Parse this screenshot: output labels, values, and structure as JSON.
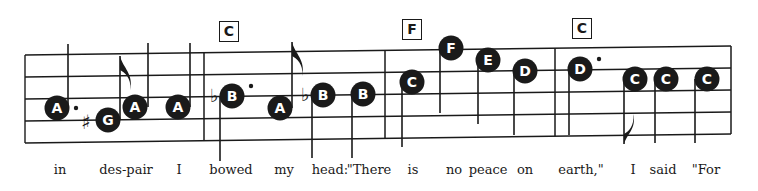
{
  "colors": {
    "ink": "#1a1a1a",
    "paper": "#ffffff",
    "note_text": "#ffffff"
  },
  "staff": {
    "left_x": 25,
    "right_x": 731,
    "lines_left_y": [
      55,
      77,
      99,
      121,
      143
    ],
    "lines_right_y": [
      46,
      68,
      90,
      112,
      134
    ],
    "barlines_x": [
      204,
      385,
      555,
      731
    ]
  },
  "chords": [
    {
      "label": "C",
      "x": 219,
      "y": 21
    },
    {
      "label": "F",
      "x": 402,
      "y": 19
    },
    {
      "label": "C",
      "x": 572,
      "y": 18
    }
  ],
  "notes": [
    {
      "name": "A",
      "cx": 57,
      "cy": 108,
      "stem": "up",
      "stem_x": 68,
      "stem_end": 44,
      "dot": true
    },
    {
      "name": "G",
      "cx": 108,
      "cy": 120,
      "stem": "up",
      "stem_x": 120,
      "stem_end": 56,
      "flag": "up",
      "accidental": "sharp"
    },
    {
      "name": "A",
      "cx": 135,
      "cy": 107,
      "stem": "up",
      "stem_x": 148,
      "stem_end": 43
    },
    {
      "name": "A",
      "cx": 178,
      "cy": 107,
      "stem": "up",
      "stem_x": 190,
      "stem_end": 43
    },
    {
      "name": "B",
      "cx": 232,
      "cy": 96,
      "stem": "down",
      "stem_x": 220,
      "stem_end": 161,
      "dot": true,
      "accidental": "flat"
    },
    {
      "name": "A",
      "cx": 280,
      "cy": 108,
      "stem": "up",
      "stem_x": 292,
      "stem_end": 42,
      "flag": "up"
    },
    {
      "name": "B",
      "cx": 323,
      "cy": 95,
      "stem": "down",
      "stem_x": 312,
      "stem_end": 158,
      "accidental": "flat"
    },
    {
      "name": "B",
      "cx": 363,
      "cy": 94,
      "stem": "down",
      "stem_x": 352,
      "stem_end": 158
    },
    {
      "name": "C",
      "cx": 412,
      "cy": 82,
      "stem": "down",
      "stem_x": 402,
      "stem_end": 147
    },
    {
      "name": "F",
      "cx": 451,
      "cy": 48,
      "stem": "down",
      "stem_x": 440,
      "stem_end": 113
    },
    {
      "name": "E",
      "cx": 488,
      "cy": 60,
      "stem": "down",
      "stem_x": 478,
      "stem_end": 124
    },
    {
      "name": "D",
      "cx": 525,
      "cy": 71,
      "stem": "down",
      "stem_x": 514,
      "stem_end": 135
    },
    {
      "name": "D",
      "cx": 580,
      "cy": 69,
      "stem": "down",
      "stem_x": 569,
      "stem_end": 135,
      "dot": true
    },
    {
      "name": "C",
      "cx": 635,
      "cy": 79,
      "stem": "down",
      "stem_x": 624,
      "stem_end": 144,
      "flag": "down"
    },
    {
      "name": "C",
      "cx": 666,
      "cy": 79,
      "stem": "down",
      "stem_x": 655,
      "stem_end": 143
    },
    {
      "name": "C",
      "cx": 707,
      "cy": 79,
      "stem": "down",
      "stem_x": 695,
      "stem_end": 143
    }
  ],
  "lyrics": [
    {
      "text": "in",
      "x": 60
    },
    {
      "text": "des-pair",
      "x": 126
    },
    {
      "text": "I",
      "x": 179
    },
    {
      "text": "bowed",
      "x": 231
    },
    {
      "text": "my",
      "x": 284
    },
    {
      "text": "head:",
      "x": 330
    },
    {
      "text": "\"There",
      "x": 369
    },
    {
      "text": "is",
      "x": 413
    },
    {
      "text": "no",
      "x": 454
    },
    {
      "text": "peace",
      "x": 488
    },
    {
      "text": "on",
      "x": 525
    },
    {
      "text": "earth,\"",
      "x": 581
    },
    {
      "text": "I",
      "x": 633
    },
    {
      "text": "said",
      "x": 663
    },
    {
      "text": "\"For",
      "x": 706
    }
  ]
}
